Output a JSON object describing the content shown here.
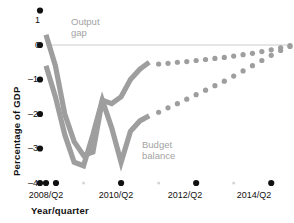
{
  "chart_data": {
    "type": "line",
    "title": "",
    "xlabel": "Year/quarter",
    "ylabel": "Percentage of GDP",
    "ylim": [
      -4,
      1
    ],
    "yticks": [
      1,
      0,
      -1,
      -2,
      -3,
      -4
    ],
    "ytick_labels": [
      "1",
      "0",
      "–1",
      "–2",
      "–3",
      "–4"
    ],
    "xticks": [
      "2008/Q2",
      "2010/Q2",
      "2012/Q2",
      "2014/Q2"
    ],
    "xtick_labels": [
      "2008/Q2",
      "2010/Q2",
      "2012/Q2",
      "2014/Q2"
    ],
    "xlim": [
      "2008/Q2",
      "2014/Q4"
    ],
    "grid": false,
    "zero_line": true,
    "legend_position": "inline-annotation",
    "series": [
      {
        "name": "Output gap",
        "color": "#9e9e9e",
        "style": "solid-then-dotted",
        "annotation": "Output\ngap",
        "x": [
          "2008/Q2",
          "2008/Q3",
          "2008/Q4",
          "2009/Q1",
          "2009/Q2",
          "2009/Q3",
          "2009/Q4",
          "2010/Q1",
          "2010/Q2",
          "2010/Q3",
          "2010/Q4",
          "2011/Q1"
        ],
        "values": [
          0.3,
          -0.6,
          -2.0,
          -2.8,
          -3.2,
          -3.1,
          -1.6,
          -1.7,
          -1.5,
          -1.0,
          -0.7,
          -0.5
        ],
        "forecast_x": [
          "2011/Q2",
          "2011/Q3",
          "2011/Q4",
          "2012/Q1",
          "2012/Q2",
          "2012/Q3",
          "2012/Q4",
          "2013/Q1",
          "2013/Q2",
          "2013/Q3",
          "2013/Q4",
          "2014/Q1",
          "2014/Q2",
          "2014/Q3",
          "2014/Q4"
        ],
        "forecast_values": [
          -0.55,
          -0.53,
          -0.5,
          -0.48,
          -0.45,
          -0.42,
          -0.39,
          -0.36,
          -0.32,
          -0.28,
          -0.24,
          -0.19,
          -0.14,
          -0.08,
          -0.02
        ]
      },
      {
        "name": "Budget balance",
        "color": "#9e9e9e",
        "style": "solid-then-dotted",
        "annotation": "Budget\nbalance",
        "x": [
          "2008/Q2",
          "2008/Q3",
          "2008/Q4",
          "2009/Q1",
          "2009/Q2",
          "2009/Q3",
          "2009/Q4",
          "2010/Q1",
          "2010/Q2",
          "2010/Q3",
          "2010/Q4",
          "2011/Q1"
        ],
        "values": [
          -0.6,
          -1.5,
          -2.6,
          -3.4,
          -3.5,
          -2.6,
          -1.6,
          -2.4,
          -3.4,
          -2.5,
          -2.2,
          -2.05
        ],
        "forecast_x": [
          "2011/Q2",
          "2011/Q3",
          "2011/Q4",
          "2012/Q1",
          "2012/Q2",
          "2012/Q3",
          "2012/Q4",
          "2013/Q1",
          "2013/Q2",
          "2013/Q3",
          "2013/Q4",
          "2014/Q1",
          "2014/Q2",
          "2014/Q3",
          "2014/Q4"
        ],
        "forecast_values": [
          -1.95,
          -1.82,
          -1.7,
          -1.57,
          -1.44,
          -1.31,
          -1.18,
          -1.05,
          -0.9,
          -0.75,
          -0.6,
          -0.45,
          -0.3,
          -0.16,
          -0.04
        ]
      }
    ],
    "colors": {
      "series": "#9e9e9e",
      "annotation_text": "#a3a3a3",
      "axis_text": "#111111",
      "zero_line": "#cccccc",
      "major_tick": "#111111",
      "minor_tick": "#d5d5d5",
      "background": "#ffffff"
    }
  }
}
